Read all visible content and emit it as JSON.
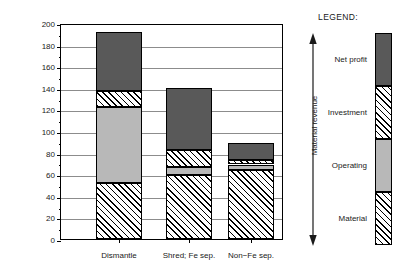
{
  "chart_data": {
    "type": "bar",
    "subtype": "stacked-bar",
    "title": "",
    "xlabel": "",
    "ylabel": "Costs per vehicle, $",
    "ylim": [
      0,
      200
    ],
    "ytick_step": 20,
    "yticks": [
      0,
      20,
      40,
      60,
      80,
      100,
      120,
      140,
      160,
      180,
      200
    ],
    "ytick_labels": [
      "0",
      "20",
      "40",
      "60",
      "80",
      "100",
      "120",
      "140",
      "160",
      "180",
      "200"
    ],
    "minor_ytick_step": 10,
    "grid": "horizontal",
    "categories": [
      "Dismantle",
      "Shred; Fe sep.",
      "Non−Fe sep."
    ],
    "series": [
      {
        "name": "Material",
        "fill": "hatch",
        "values": [
          52,
          59,
          64
        ]
      },
      {
        "name": "Operating",
        "fill": "light-gray",
        "values": [
          70,
          8,
          5
        ]
      },
      {
        "name": "Investment",
        "fill": "hatch",
        "values": [
          15,
          15,
          4
        ]
      },
      {
        "name": "Net profit",
        "fill": "dark-gray",
        "values": [
          55,
          58,
          16
        ]
      }
    ],
    "cumulative_tops": [
      [
        52,
        122,
        137,
        192
      ],
      [
        59,
        67,
        82,
        140
      ],
      [
        64,
        69,
        73,
        89
      ]
    ],
    "totals": [
      192,
      140,
      89
    ],
    "legend": {
      "position": "right",
      "title": "LEGEND:",
      "axis_label": "Material revenue",
      "axis_arrow": "double-headed-vertical",
      "entries": [
        {
          "label": "Net profit",
          "fill": "dark-gray"
        },
        {
          "label": "Investment",
          "fill": "hatch"
        },
        {
          "label": "Operating",
          "fill": "light-gray"
        },
        {
          "label": "Material",
          "fill": "hatch"
        }
      ]
    },
    "colors": {
      "dark_gray": "#595959",
      "light_gray": "#b8b8b8",
      "hatch_line": "#000000",
      "hatch_background": "#ffffff",
      "axis": "#000000",
      "gridline": "#8c8c8c",
      "text": "#1a1a1a",
      "background": "#ffffff"
    }
  }
}
